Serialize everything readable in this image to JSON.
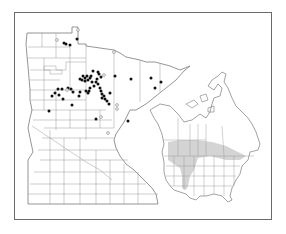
{
  "map": {
    "region": "Minnesota",
    "inset_region": "North America",
    "colors": {
      "background": "#ffffff",
      "frame": "#6a6a6a",
      "boundary": "#8a8a8a",
      "dot_filled": "#111111",
      "dot_open_stroke": "#777777",
      "range_shading": "#d4d4d4"
    },
    "legend_symbols": {
      "filled_dot": "specimen-record",
      "open_dot": "other-record"
    },
    "filled_dots": [
      [
        64,
        43
      ],
      [
        66,
        44
      ],
      [
        70,
        45
      ],
      [
        77,
        39
      ],
      [
        98,
        72
      ],
      [
        99,
        74
      ],
      [
        101,
        77
      ],
      [
        97,
        79
      ],
      [
        96,
        82
      ],
      [
        98,
        84
      ],
      [
        94,
        86
      ],
      [
        92,
        82
      ],
      [
        90,
        78
      ],
      [
        88,
        80
      ],
      [
        87,
        76
      ],
      [
        91,
        76
      ],
      [
        93,
        71
      ],
      [
        85,
        78
      ],
      [
        82,
        80
      ],
      [
        80,
        79
      ],
      [
        83,
        76
      ],
      [
        90,
        88
      ],
      [
        89,
        91
      ],
      [
        88,
        93
      ],
      [
        100,
        88
      ],
      [
        101,
        91
      ],
      [
        102,
        94
      ],
      [
        104,
        96
      ],
      [
        105,
        99
      ],
      [
        107,
        101
      ],
      [
        109,
        104
      ],
      [
        110,
        93
      ],
      [
        102,
        98
      ],
      [
        68,
        88
      ],
      [
        62,
        89
      ],
      [
        55,
        93
      ],
      [
        58,
        89
      ],
      [
        59,
        95
      ],
      [
        63,
        99
      ],
      [
        52,
        96
      ],
      [
        71,
        89
      ],
      [
        73,
        92
      ],
      [
        79,
        96
      ],
      [
        86,
        91
      ],
      [
        80,
        92
      ],
      [
        72,
        105
      ],
      [
        85,
        81
      ],
      [
        49,
        111
      ],
      [
        96,
        119
      ],
      [
        115,
        76
      ],
      [
        131,
        79
      ],
      [
        151,
        78
      ],
      [
        161,
        82
      ],
      [
        155,
        88
      ],
      [
        128,
        121
      ]
    ],
    "open_dots": [
      [
        78,
        30
      ],
      [
        57,
        40
      ],
      [
        114,
        52
      ],
      [
        104,
        75
      ],
      [
        67,
        90
      ],
      [
        117,
        105
      ],
      [
        117,
        109
      ],
      [
        101,
        117
      ],
      [
        108,
        133
      ]
    ]
  }
}
